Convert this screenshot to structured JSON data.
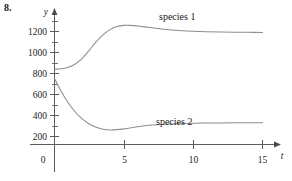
{
  "exercise": {
    "number": "8."
  },
  "chart_data": {
    "type": "line",
    "title": "",
    "subtitle": "",
    "xlabel": "t",
    "ylabel": "y",
    "grid": false,
    "legend_position": "inline-annotation",
    "xlim": [
      0,
      16.5
    ],
    "ylim": [
      0,
      1400
    ],
    "x_ticks_major": [
      0,
      5,
      10,
      15
    ],
    "x_tick_labels": [
      "0",
      "5",
      "10",
      "15"
    ],
    "y_ticks_major": [
      200,
      400,
      600,
      800,
      1000,
      1200
    ],
    "y_tick_labels": [
      "200",
      "400",
      "600",
      "800",
      "1000",
      "1200"
    ],
    "y_ticks_minor": [
      100,
      300,
      500,
      700,
      900,
      1100,
      1300
    ],
    "annotations": [
      {
        "text": "species 1",
        "x": 7.6,
        "y": 1340
      },
      {
        "text": "species 2",
        "x": 7.4,
        "y": 330
      }
    ],
    "series": [
      {
        "name": "species 1",
        "color": "#8d8d8d",
        "x": [
          0,
          0.5,
          1,
          1.5,
          2,
          2.5,
          3,
          3.5,
          4,
          4.5,
          5,
          5.5,
          6,
          7,
          8,
          9,
          10,
          11,
          12,
          13,
          14,
          15
        ],
        "values": [
          800,
          805,
          820,
          855,
          915,
          1000,
          1090,
          1165,
          1220,
          1252,
          1265,
          1265,
          1258,
          1240,
          1222,
          1210,
          1202,
          1197,
          1194,
          1192,
          1191,
          1190
        ]
      },
      {
        "name": "species 2",
        "color": "#8d8d8d",
        "x": [
          0,
          0.5,
          1,
          1.5,
          2,
          2.5,
          3,
          3.5,
          4,
          4.5,
          5,
          5.5,
          6,
          7,
          8,
          9,
          10,
          11,
          12,
          13,
          14,
          15
        ],
        "values": [
          700,
          560,
          440,
          345,
          272,
          218,
          182,
          162,
          155,
          158,
          166,
          177,
          188,
          206,
          216,
          222,
          226,
          228,
          229,
          230,
          230,
          230
        ]
      }
    ]
  },
  "axes": {
    "y_axis_label": "y",
    "x_axis_label": "t"
  }
}
